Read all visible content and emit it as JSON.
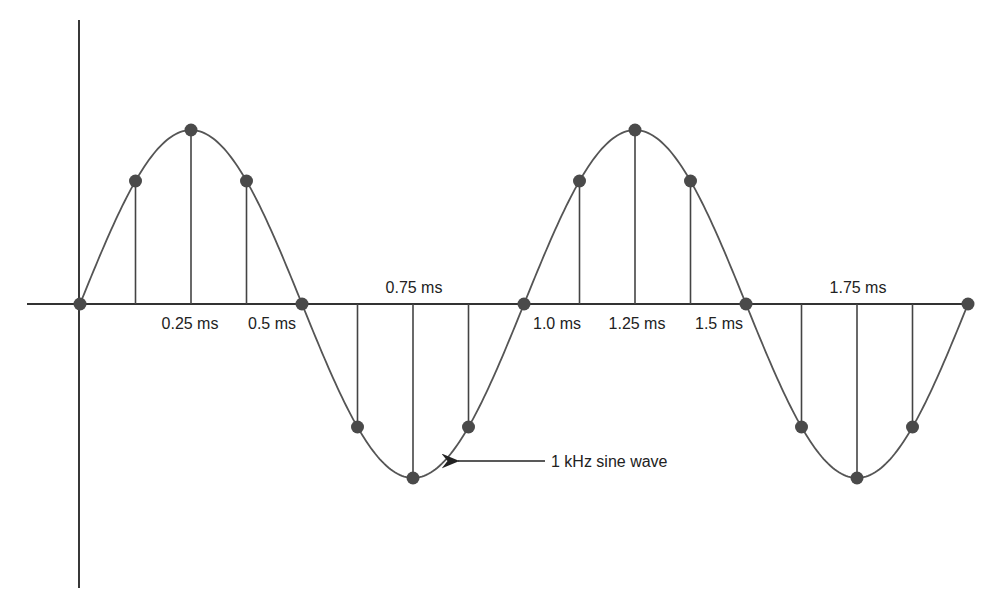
{
  "diagram": {
    "wave_label": "1 kHz sine wave",
    "time_labels": [
      {
        "text": "0.25 ms",
        "x": 190,
        "y": 329,
        "anchor": "middle"
      },
      {
        "text": "0.5 ms",
        "x": 272,
        "y": 329,
        "anchor": "middle"
      },
      {
        "text": "0.75 ms",
        "x": 414,
        "y": 293,
        "anchor": "middle"
      },
      {
        "text": "1.0 ms",
        "x": 557,
        "y": 329,
        "anchor": "middle"
      },
      {
        "text": "1.25 ms",
        "x": 637,
        "y": 329,
        "anchor": "middle"
      },
      {
        "text": "1.5 ms",
        "x": 719,
        "y": 329,
        "anchor": "middle"
      },
      {
        "text": "1.75 ms",
        "x": 858,
        "y": 293,
        "anchor": "middle"
      }
    ],
    "colors": {
      "axis": "#222222",
      "curve": "#555555",
      "sample_dot": "#4a4a4a",
      "stem": "#444444"
    }
  },
  "chart_data": {
    "type": "line",
    "title": "",
    "xlabel": "time (ms)",
    "ylabel": "",
    "signal": "1 kHz sine wave",
    "frequency_hz": 1000,
    "sample_interval_ms": 0.125,
    "x": [
      0,
      0.125,
      0.25,
      0.375,
      0.5,
      0.625,
      0.75,
      0.875,
      1.0,
      1.125,
      1.25,
      1.375,
      1.5,
      1.625,
      1.75,
      1.875,
      2.0
    ],
    "values": [
      0,
      0.707,
      1,
      0.707,
      0,
      -0.707,
      -1,
      -0.707,
      0,
      0.707,
      1,
      0.707,
      0,
      -0.707,
      -1,
      -0.707,
      0
    ],
    "tick_labels": [
      "0.25 ms",
      "0.5 ms",
      "0.75 ms",
      "1.0 ms",
      "1.25 ms",
      "1.5 ms",
      "1.75 ms"
    ],
    "ylim": [
      -1,
      1
    ],
    "grid": false,
    "legend": false,
    "annotations": [
      "1 kHz sine wave"
    ]
  }
}
